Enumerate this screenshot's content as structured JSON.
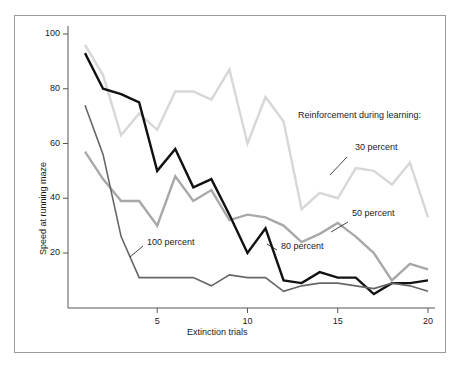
{
  "chart_data": {
    "type": "line",
    "title": "",
    "xlabel": "Extinction trials",
    "ylabel": "Speed at running maze",
    "xlim": [
      1,
      20
    ],
    "ylim": [
      0,
      100
    ],
    "xticks": [
      5,
      10,
      15,
      20
    ],
    "yticks": [
      20,
      40,
      60,
      80,
      100
    ],
    "grid": false,
    "legend_title": "Reinforcement during learning:",
    "legend_position": "inline-annotations",
    "x": [
      1,
      2,
      3,
      4,
      5,
      6,
      7,
      8,
      9,
      10,
      11,
      12,
      13,
      14,
      15,
      16,
      17,
      18,
      19,
      20
    ],
    "series": [
      {
        "name": "30 percent",
        "color": "#d7d7d7",
        "width": 2.4,
        "label": "30 percent",
        "values": [
          96,
          85,
          63,
          71,
          65,
          79,
          79,
          76,
          87,
          60,
          77,
          68,
          36,
          42,
          40,
          51,
          50,
          45,
          53,
          33
        ]
      },
      {
        "name": "50 percent",
        "color": "#a8a8a8",
        "width": 2.4,
        "label": "50 percent",
        "values": [
          57,
          47,
          39,
          39,
          30,
          48,
          39,
          43,
          32,
          34,
          33,
          30,
          24,
          27,
          31,
          26,
          20,
          10,
          16,
          14
        ]
      },
      {
        "name": "80 percent",
        "color": "#111111",
        "width": 2.4,
        "label": "80 percent",
        "values": [
          93,
          80,
          78,
          75,
          50,
          58,
          44,
          47,
          34,
          20,
          29,
          10,
          9,
          13,
          11,
          11,
          5,
          9,
          9,
          10
        ]
      },
      {
        "name": "100 percent",
        "color": "#666666",
        "width": 1.6,
        "label": "100 percent",
        "values": [
          74,
          56,
          26,
          11,
          11,
          11,
          11,
          8,
          12,
          11,
          11,
          6,
          8,
          9,
          9,
          8,
          7,
          9,
          8,
          6
        ]
      }
    ],
    "annotations": [
      {
        "text": "30 percent",
        "x": 355,
        "y": 148,
        "leader": [
          [
            347,
            157
          ],
          [
            330,
            175
          ]
        ]
      },
      {
        "text": "50 percent",
        "x": 352,
        "y": 214,
        "leader": [
          [
            348,
            222
          ],
          [
            331,
            232
          ]
        ]
      },
      {
        "text": "80 percent",
        "x": 281,
        "y": 247,
        "leader": [
          [
            277,
            250
          ],
          [
            267,
            244
          ]
        ]
      },
      {
        "text": "100 percent",
        "x": 147,
        "y": 243,
        "leader": [
          [
            143,
            246
          ],
          [
            130,
            257
          ]
        ]
      }
    ]
  },
  "axes": {
    "y_tick_labels": [
      "100",
      "80",
      "60",
      "40",
      "20"
    ],
    "x_tick_labels": [
      "5",
      "10",
      "15",
      "20"
    ],
    "x_title": "Extinction trials",
    "y_title": "Speed at running maze"
  },
  "legend": {
    "title": "Reinforcement during learning:"
  },
  "colors": {
    "background": "#ffffff",
    "frame": "#9a9a9a",
    "axis": "#555555",
    "text": "#1a1a1a"
  }
}
